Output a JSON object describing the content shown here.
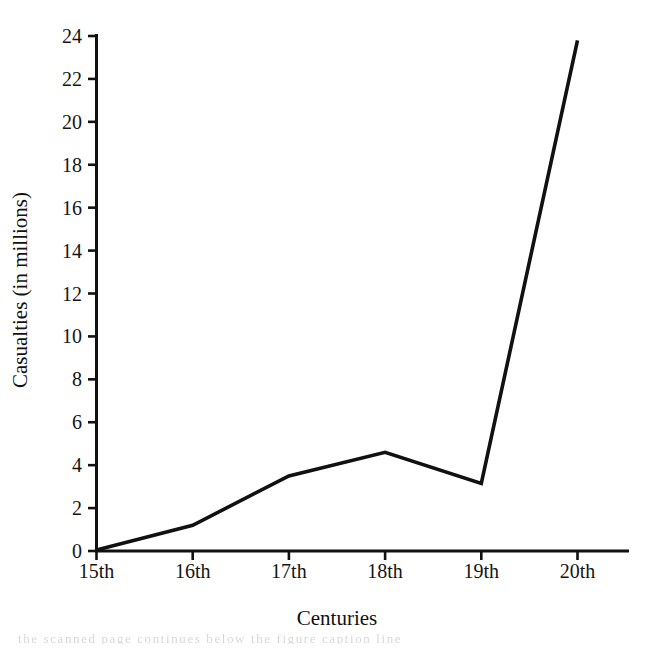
{
  "chart_data": {
    "type": "line",
    "title": "",
    "xlabel": "Centuries",
    "ylabel": "Casualties (in millions)",
    "categories": [
      "15th",
      "16th",
      "17th",
      "18th",
      "19th",
      "20th"
    ],
    "values": [
      0.05,
      1.2,
      3.5,
      4.6,
      3.15,
      23.8
    ],
    "series": [
      {
        "name": "Casualties",
        "values": [
          0.05,
          1.2,
          3.5,
          4.6,
          3.15,
          23.8
        ]
      }
    ],
    "ylim": [
      0,
      24
    ],
    "yticks": [
      0,
      2,
      4,
      6,
      8,
      10,
      12,
      14,
      16,
      18,
      20,
      22,
      24
    ],
    "ytick_labels": [
      "0",
      "2",
      "4",
      "6",
      "8",
      "10",
      "12",
      "14",
      "16",
      "18",
      "20",
      "22",
      "24"
    ],
    "xtick_labels": [
      "15th",
      "16th",
      "17th",
      "18th",
      "19th",
      "20th"
    ],
    "grid": false,
    "legend": false,
    "legend_position": "none",
    "line_color": "#111111",
    "background_color": "#ffffff",
    "axis_color": "#111111",
    "annotations": []
  },
  "artifact": {
    "bottom_text": "the scanned page continues below the figure caption line"
  }
}
